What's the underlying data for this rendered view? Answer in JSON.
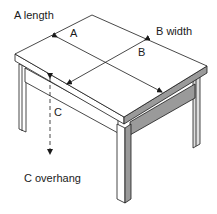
{
  "diagram": {
    "labels": {
      "a_length": "A length",
      "b_width": "B width",
      "c_overhang": "C overhang",
      "a": "A",
      "b": "B",
      "c": "C"
    },
    "colors": {
      "line": "#1a1a1a",
      "shade": "#9a9a9a",
      "background": "#ffffff"
    }
  }
}
